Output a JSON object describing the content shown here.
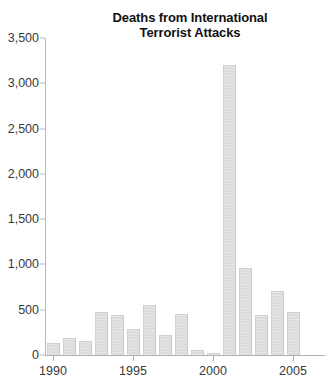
{
  "chart_data": {
    "type": "bar",
    "title": "Deaths from International Terrorist Attacks",
    "title_lines": [
      "Deaths from International",
      "Terrorist Attacks"
    ],
    "xlabel": "",
    "ylabel": "",
    "categories": [
      "1990",
      "1991",
      "1992",
      "1993",
      "1994",
      "1995",
      "1996",
      "1997",
      "1998",
      "1999",
      "2000",
      "2001",
      "2002",
      "2003",
      "2004",
      "2005"
    ],
    "values": [
      130,
      190,
      150,
      480,
      440,
      290,
      550,
      220,
      450,
      50,
      20,
      3200,
      960,
      440,
      710,
      470
    ],
    "x_tick_labels": [
      "1990",
      "1995",
      "2000",
      "2005"
    ],
    "x_tick_values": [
      1990,
      1995,
      2000,
      2005
    ],
    "y_tick_labels": [
      "0",
      "500",
      "1,000",
      "1,500",
      "2,000",
      "2,500",
      "3,000",
      "3,500"
    ],
    "y_tick_values": [
      0,
      500,
      1000,
      1500,
      2000,
      2500,
      3000,
      3500
    ],
    "ylim": [
      0,
      3500
    ],
    "xlim": [
      1989.4,
      2005.6
    ],
    "grid": false,
    "legend": false,
    "bar_color": "#e0e0e0",
    "bar_edge_color": "#cccccc",
    "axis_color": "#b5b5b5",
    "text_color": "#333333"
  }
}
